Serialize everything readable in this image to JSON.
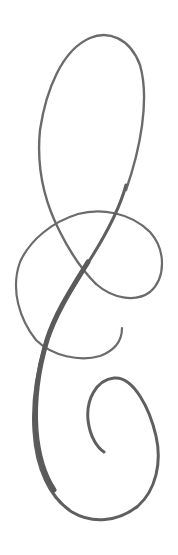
{
  "image": {
    "subject": "calligraphic flourish ornament",
    "background_color": "#ffffff",
    "stroke_color": "#6b6b6b",
    "thick_stroke_color": "#5f5f5f"
  }
}
